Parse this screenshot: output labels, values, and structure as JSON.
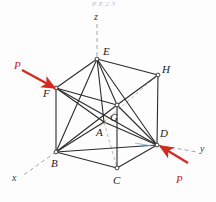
{
  "figure": {
    "caption_top": "P E                 2 3",
    "caption_bottom": "",
    "stroke_color": "#2b2b2b",
    "dash_color": "#9a9aa6",
    "force_color": "#d42b20",
    "background": "#fdfdfd"
  },
  "axes": [
    {
      "name": "z",
      "label": "z",
      "x": 97,
      "y": 18
    },
    {
      "name": "y",
      "label": "y",
      "x": 201,
      "y": 150
    },
    {
      "name": "x",
      "label": "x",
      "x": 14,
      "y": 180
    }
  ],
  "vertices": [
    {
      "id": "A",
      "label": "A",
      "px": 104,
      "py": 122,
      "lx": 96,
      "ly": 136,
      "visible_node": false
    },
    {
      "id": "B",
      "label": "B",
      "px": 56,
      "py": 152,
      "lx": 51,
      "ly": 167,
      "visible_node": true
    },
    {
      "id": "C",
      "label": "C",
      "px": 117,
      "py": 168,
      "lx": 113,
      "ly": 184,
      "visible_node": true
    },
    {
      "id": "D",
      "label": "D",
      "px": 157,
      "py": 145,
      "lx": 160,
      "ly": 137,
      "visible_node": true
    },
    {
      "id": "E",
      "label": "E",
      "px": 97,
      "py": 59,
      "lx": 103,
      "ly": 55,
      "visible_node": true
    },
    {
      "id": "F",
      "label": "F",
      "px": 56,
      "py": 88,
      "lx": 44,
      "ly": 97,
      "visible_node": true
    },
    {
      "id": "G",
      "label": "G",
      "px": 117,
      "py": 105,
      "lx": 110,
      "ly": 121,
      "visible_node": true
    },
    {
      "id": "H",
      "label": "H",
      "px": 158,
      "py": 75,
      "lx": 162,
      "ly": 73,
      "visible_node": true
    }
  ],
  "members": [
    {
      "from": "B",
      "to": "F",
      "style": "solid"
    },
    {
      "from": "B",
      "to": "C",
      "style": "solid"
    },
    {
      "from": "B",
      "to": "D",
      "style": "solid"
    },
    {
      "from": "B",
      "to": "E",
      "style": "solid"
    },
    {
      "from": "B",
      "to": "G",
      "style": "solid"
    },
    {
      "from": "B",
      "to": "A",
      "style": "solid"
    },
    {
      "from": "C",
      "to": "D",
      "style": "solid"
    },
    {
      "from": "C",
      "to": "G",
      "style": "solid"
    },
    {
      "from": "D",
      "to": "H",
      "style": "solid"
    },
    {
      "from": "D",
      "to": "G",
      "style": "solid"
    },
    {
      "from": "D",
      "to": "E",
      "style": "solid"
    },
    {
      "from": "D",
      "to": "A",
      "style": "solid"
    },
    {
      "from": "D",
      "to": "F",
      "style": "solid"
    },
    {
      "from": "E",
      "to": "F",
      "style": "solid"
    },
    {
      "from": "E",
      "to": "H",
      "style": "solid"
    },
    {
      "from": "E",
      "to": "G",
      "style": "solid"
    },
    {
      "from": "E",
      "to": "A",
      "style": "solid"
    },
    {
      "from": "F",
      "to": "G",
      "style": "solid"
    },
    {
      "from": "F",
      "to": "A",
      "style": "solid"
    },
    {
      "from": "G",
      "to": "H",
      "style": "solid"
    },
    {
      "from": "A",
      "to": "C",
      "style": "hidden-dashed"
    },
    {
      "from": "A",
      "to": "F",
      "style": "hidden-dashed"
    },
    {
      "from": "A",
      "to": "H",
      "style": "hidden-dashed"
    }
  ],
  "forces": [
    {
      "name": "force-upper-left",
      "label": "P",
      "label_x": 16,
      "label_y": 66,
      "tail_x": 22,
      "tail_y": 70,
      "head_x": 55,
      "head_y": 88
    },
    {
      "name": "force-lower-right",
      "label": "P",
      "label_x": 178,
      "label_y": 182,
      "tail_x": 188,
      "tail_y": 163,
      "head_x": 159,
      "head_y": 146
    }
  ]
}
